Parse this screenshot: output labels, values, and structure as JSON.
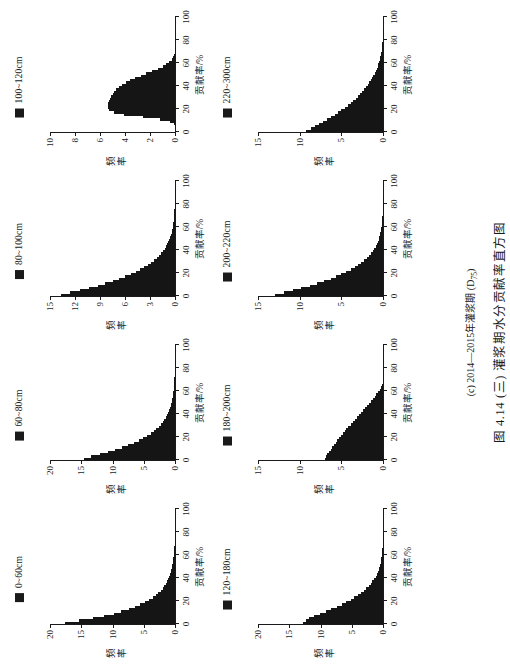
{
  "figure": {
    "subcaption_pre": "(c) 2014—2015年灌浆期 (D",
    "subcaption_sub": "75",
    "subcaption_post": ")",
    "main_caption": "图 4.14 (三)  灌浆期水分贡献率直方图",
    "xlabel": "贡献率/%",
    "ylabel": "频率"
  },
  "chart_data": {
    "type": "bar",
    "title": "图 4.14 (三)  灌浆期水分贡献率直方图",
    "subtitle": "(c) 2014—2015年灌浆期 (D75)",
    "xlabel": "贡献率/%",
    "ylabel": "频率",
    "grid": false,
    "legend_position": "top-center",
    "xlim": [
      0,
      100
    ],
    "xticks": [
      0,
      20,
      40,
      60,
      80,
      100
    ],
    "panels": [
      {
        "legend": "0~60cm",
        "ylim": [
          0,
          20
        ],
        "yticks": [
          0,
          5,
          10,
          15,
          20
        ],
        "bin_width": 2,
        "x": [
          1,
          3,
          5,
          7,
          9,
          11,
          13,
          15,
          17,
          19,
          21,
          23,
          25,
          27,
          29,
          31,
          33,
          35,
          37,
          39,
          41,
          43,
          45,
          47,
          49,
          51,
          53,
          55,
          57,
          59,
          61,
          63,
          65,
          67,
          69,
          71,
          73,
          75,
          77,
          79,
          81,
          83,
          85,
          87,
          89,
          91,
          93,
          95,
          97,
          99
        ],
        "values": [
          17.6,
          15.4,
          13.1,
          11.3,
          9.8,
          8.6,
          7.4,
          6.4,
          5.6,
          4.8,
          4.2,
          3.6,
          3.1,
          2.7,
          2.3,
          2.0,
          1.7,
          1.5,
          1.3,
          1.1,
          0.95,
          0.8,
          0.7,
          0.6,
          0.5,
          0.42,
          0.36,
          0.3,
          0.25,
          0.2,
          0.17,
          0.14,
          0.11,
          0.09,
          0.07,
          0.06,
          0.05,
          0.04,
          0.03,
          0.02,
          0.02,
          0.01,
          0.01,
          0.01,
          0.01,
          0,
          0,
          0,
          0,
          0
        ]
      },
      {
        "legend": "60~80cm",
        "ylim": [
          0,
          20
        ],
        "yticks": [
          0,
          5,
          10,
          15,
          20
        ],
        "bin_width": 2,
        "x": [
          1,
          3,
          5,
          7,
          9,
          11,
          13,
          15,
          17,
          19,
          21,
          23,
          25,
          27,
          29,
          31,
          33,
          35,
          37,
          39,
          41,
          43,
          45,
          47,
          49,
          51,
          53,
          55,
          57,
          59,
          61,
          63,
          65,
          67,
          69,
          71,
          73,
          75,
          77,
          79,
          81,
          83,
          85,
          87,
          89,
          91,
          93,
          95,
          97,
          99
        ],
        "values": [
          14.6,
          13.4,
          12.0,
          10.8,
          9.6,
          8.5,
          7.5,
          6.6,
          5.8,
          5.1,
          4.5,
          3.9,
          3.4,
          3.0,
          2.6,
          2.3,
          2.0,
          1.7,
          1.5,
          1.3,
          1.1,
          0.95,
          0.82,
          0.7,
          0.6,
          0.52,
          0.45,
          0.38,
          0.32,
          0.27,
          0.23,
          0.19,
          0.16,
          0.13,
          0.11,
          0.09,
          0.07,
          0.06,
          0.05,
          0.04,
          0.03,
          0.02,
          0.02,
          0.01,
          0.01,
          0.01,
          0,
          0,
          0,
          0
        ]
      },
      {
        "legend": "80~100cm",
        "ylim": [
          0,
          15
        ],
        "yticks": [
          0,
          3,
          6,
          9,
          12,
          15
        ],
        "bin_width": 2,
        "x": [
          1,
          3,
          5,
          7,
          9,
          11,
          13,
          15,
          17,
          19,
          21,
          23,
          25,
          27,
          29,
          31,
          33,
          35,
          37,
          39,
          41,
          43,
          45,
          47,
          49,
          51,
          53,
          55,
          57,
          59,
          61,
          63,
          65,
          67,
          69,
          71,
          73,
          75,
          77,
          79,
          81,
          83,
          85,
          87,
          89,
          91,
          93,
          95,
          97,
          99
        ],
        "values": [
          13.7,
          12.6,
          11.4,
          10.3,
          9.3,
          8.4,
          7.5,
          6.7,
          6.0,
          5.3,
          4.7,
          4.2,
          3.7,
          3.3,
          2.9,
          2.5,
          2.2,
          1.9,
          1.7,
          1.45,
          1.25,
          1.08,
          0.92,
          0.8,
          0.68,
          0.58,
          0.5,
          0.42,
          0.36,
          0.3,
          0.26,
          0.22,
          0.18,
          0.15,
          0.12,
          0.1,
          0.08,
          0.07,
          0.05,
          0.04,
          0.03,
          0.03,
          0.02,
          0.02,
          0.01,
          0.01,
          0.01,
          0,
          0,
          0
        ]
      },
      {
        "legend": "100~120cm",
        "ylim": [
          0,
          10
        ],
        "yticks": [
          0,
          2,
          4,
          6,
          8,
          10
        ],
        "bin_width": 2,
        "x": [
          1,
          3,
          5,
          7,
          9,
          11,
          13,
          15,
          17,
          19,
          21,
          23,
          25,
          27,
          29,
          31,
          33,
          35,
          37,
          39,
          41,
          43,
          45,
          47,
          49,
          51,
          53,
          55,
          57,
          59,
          61,
          63,
          65,
          67,
          69,
          71,
          73,
          75,
          77,
          79,
          81,
          83,
          85,
          87,
          89,
          91,
          93,
          95,
          97,
          99
        ],
        "values": [
          0,
          0,
          0,
          0.1,
          0.4,
          1.2,
          2.6,
          4.1,
          4.9,
          5.3,
          5.4,
          5.4,
          5.35,
          5.3,
          5.2,
          5.1,
          5.0,
          4.85,
          4.7,
          4.5,
          4.25,
          3.95,
          3.6,
          3.2,
          2.75,
          2.3,
          1.85,
          1.4,
          1.0,
          0.7,
          0.45,
          0.28,
          0.16,
          0.08,
          0.04,
          0.02,
          0.01,
          0,
          0,
          0,
          0,
          0,
          0,
          0,
          0,
          0,
          0,
          0,
          0,
          0
        ]
      },
      {
        "legend": "120~180cm",
        "ylim": [
          0,
          20
        ],
        "yticks": [
          0,
          5,
          10,
          15,
          20
        ],
        "bin_width": 2,
        "x": [
          1,
          3,
          5,
          7,
          9,
          11,
          13,
          15,
          17,
          19,
          21,
          23,
          25,
          27,
          29,
          31,
          33,
          35,
          37,
          39,
          41,
          43,
          45,
          47,
          49,
          51,
          53,
          55,
          57,
          59,
          61,
          63,
          65,
          67,
          69,
          71,
          73,
          75,
          77,
          79,
          81,
          83,
          85,
          87,
          89,
          91,
          93,
          95,
          97,
          99
        ],
        "values": [
          12.8,
          12.4,
          11.8,
          11.0,
          10.1,
          9.2,
          8.3,
          7.4,
          6.6,
          5.9,
          5.2,
          4.6,
          4.0,
          3.5,
          3.1,
          2.7,
          2.3,
          2.0,
          1.7,
          1.45,
          1.2,
          1.0,
          0.85,
          0.7,
          0.58,
          0.48,
          0.4,
          0.32,
          0.26,
          0.2,
          0.16,
          0.13,
          0.1,
          0.08,
          0.06,
          0.05,
          0.04,
          0.03,
          0.02,
          0.02,
          0.01,
          0.01,
          0.01,
          0,
          0,
          0,
          0,
          0,
          0,
          0
        ]
      },
      {
        "legend": "180~200cm",
        "ylim": [
          0,
          15
        ],
        "yticks": [
          0,
          5,
          10,
          15
        ],
        "bin_width": 2,
        "x": [
          1,
          3,
          5,
          7,
          9,
          11,
          13,
          15,
          17,
          19,
          21,
          23,
          25,
          27,
          29,
          31,
          33,
          35,
          37,
          39,
          41,
          43,
          45,
          47,
          49,
          51,
          53,
          55,
          57,
          59,
          61,
          63,
          65,
          67,
          69,
          71,
          73,
          75,
          77,
          79,
          81,
          83,
          85,
          87,
          89,
          91,
          93,
          95,
          97,
          99
        ],
        "values": [
          7.0,
          6.85,
          6.7,
          6.5,
          6.3,
          6.1,
          5.9,
          5.7,
          5.5,
          5.3,
          5.1,
          4.85,
          4.6,
          4.4,
          4.15,
          3.9,
          3.65,
          3.4,
          3.15,
          2.9,
          2.65,
          2.4,
          2.15,
          1.9,
          1.65,
          1.4,
          1.2,
          1.0,
          0.8,
          0.6,
          0.42,
          0.25,
          0.1,
          0,
          0,
          0,
          0,
          0,
          0,
          0,
          0,
          0,
          0,
          0,
          0,
          0,
          0,
          0,
          0,
          0
        ]
      },
      {
        "legend": "200~220cm",
        "ylim": [
          0,
          15
        ],
        "yticks": [
          0,
          5,
          10,
          15
        ],
        "bin_width": 2,
        "x": [
          1,
          3,
          5,
          7,
          9,
          11,
          13,
          15,
          17,
          19,
          21,
          23,
          25,
          27,
          29,
          31,
          33,
          35,
          37,
          39,
          41,
          43,
          45,
          47,
          49,
          51,
          53,
          55,
          57,
          59,
          61,
          63,
          65,
          67,
          69,
          71,
          73,
          75,
          77,
          79,
          81,
          83,
          85,
          87,
          89,
          91,
          93,
          95,
          97,
          99
        ],
        "values": [
          13.0,
          11.9,
          10.8,
          9.8,
          8.8,
          7.9,
          7.1,
          6.3,
          5.6,
          5.0,
          4.4,
          3.9,
          3.4,
          3.0,
          2.6,
          2.25,
          1.95,
          1.7,
          1.45,
          1.25,
          1.05,
          0.9,
          0.75,
          0.64,
          0.54,
          0.45,
          0.38,
          0.32,
          0.26,
          0.22,
          0.18,
          0.15,
          0.12,
          0.1,
          0.08,
          0.06,
          0.05,
          0.04,
          0.03,
          0.02,
          0.02,
          0.01,
          0.01,
          0.01,
          0,
          0,
          0,
          0,
          0,
          0
        ]
      },
      {
        "legend": "220~300cm",
        "ylim": [
          0,
          15
        ],
        "yticks": [
          0,
          5,
          10,
          15
        ],
        "bin_width": 2,
        "x": [
          1,
          3,
          5,
          7,
          9,
          11,
          13,
          15,
          17,
          19,
          21,
          23,
          25,
          27,
          29,
          31,
          33,
          35,
          37,
          39,
          41,
          43,
          45,
          47,
          49,
          51,
          53,
          55,
          57,
          59,
          61,
          63,
          65,
          67,
          69,
          71,
          73,
          75,
          77,
          79,
          81,
          83,
          85,
          87,
          89,
          91,
          93,
          95,
          97,
          99
        ],
        "values": [
          9.2,
          8.7,
          8.2,
          7.7,
          7.2,
          6.7,
          6.2,
          5.8,
          5.4,
          5.0,
          4.6,
          4.25,
          3.9,
          3.6,
          3.3,
          3.0,
          2.75,
          2.5,
          2.25,
          2.05,
          1.85,
          1.65,
          1.48,
          1.3,
          1.15,
          1.0,
          0.88,
          0.76,
          0.65,
          0.55,
          0.46,
          0.38,
          0.31,
          0.25,
          0.2,
          0.16,
          0.12,
          0.09,
          0.07,
          0.05,
          0.04,
          0.03,
          0.02,
          0.015,
          0.01,
          0.008,
          0.005,
          0.003,
          0.002,
          0.001
        ]
      }
    ]
  }
}
